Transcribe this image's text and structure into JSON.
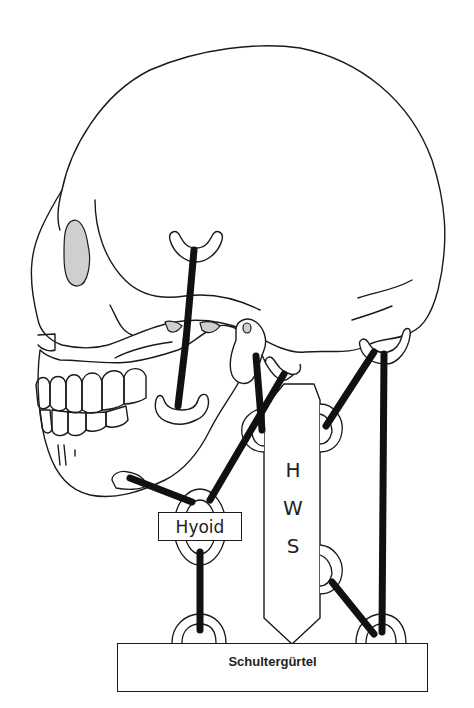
{
  "diagram": {
    "type": "anatomical muscle connection diagram",
    "structures": {
      "skull": "skull (lateral view)",
      "hyoid": "Hyoid",
      "cervical_spine": [
        "H",
        "W",
        "S"
      ],
      "shoulder_girdle": "Schultergürtel"
    },
    "labels": {
      "hyoid": "Hyoid",
      "hws_letters": [
        "H",
        "W",
        "S"
      ],
      "schultergurtel": "Schultergürtel"
    },
    "connections": [
      {
        "from": "skull-temporal",
        "to": "mandible-coronoid"
      },
      {
        "from": "mandible",
        "to": "hyoid"
      },
      {
        "from": "hws",
        "to": "hyoid"
      },
      {
        "from": "mastoid",
        "to": "hws"
      },
      {
        "from": "occiput",
        "to": "hws"
      },
      {
        "from": "occiput",
        "to": "schultergurtel"
      },
      {
        "from": "hws",
        "to": "schultergurtel"
      },
      {
        "from": "hyoid",
        "to": "schultergurtel"
      },
      {
        "from": "skull-base",
        "to": "hws"
      }
    ],
    "colors": {
      "line": "#111111",
      "background": "#ffffff",
      "stipple": "#cfcfcf"
    }
  }
}
